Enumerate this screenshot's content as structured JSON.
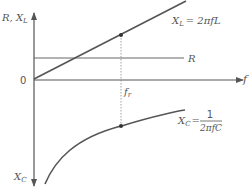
{
  "diagram": {
    "y_axis_top_label": "R, X_L",
    "y_axis_top_label_main": "R, X",
    "y_axis_top_label_sub": "L",
    "y_axis_bottom_label_main": "X",
    "y_axis_bottom_label_sub": "C",
    "x_axis_label": "f",
    "origin_label": "0",
    "resonance_label_main": "f",
    "resonance_label_sub": "r",
    "resistance_label": "R",
    "xl_formula": {
      "lhs_main": "X",
      "lhs_sub": "L",
      "rhs": "= 2πfL"
    },
    "xc_formula": {
      "lhs_main": "X",
      "lhs_sub": "C",
      "eq": "=",
      "numerator": "1",
      "denominator": "2πfC"
    },
    "curves": [
      {
        "name": "X_L",
        "shape": "straight line rising from origin",
        "marked_point_at": "f_r"
      },
      {
        "name": "R",
        "shape": "horizontal constant line"
      },
      {
        "name": "X_C",
        "shape": "hyperbola-like curve below axis, approaching axis as f increases",
        "marked_point_at": "f_r"
      }
    ],
    "colors": {
      "line": "#555555",
      "dash": "#888888",
      "text": "#555555"
    }
  }
}
